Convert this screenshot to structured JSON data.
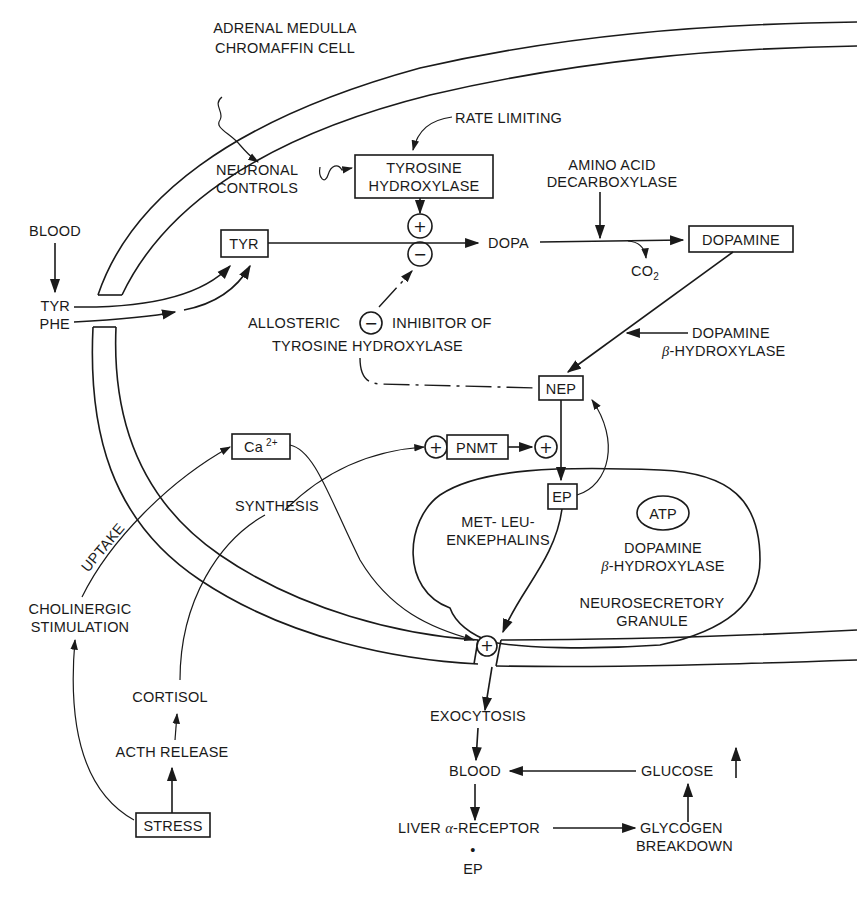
{
  "diagram": {
    "title_line1": "ADRENAL MEDULLA",
    "title_line2": "CHROMAFFIN CELL",
    "colors": {
      "ink": "#1a1a1a",
      "background": "#ffffff"
    },
    "labels": {
      "rate_limiting": "RATE LIMITING",
      "neuronal_controls_1": "NEURONAL",
      "neuronal_controls_2": "CONTROLS",
      "tyrosine_hydroxylase_1": "TYROSINE",
      "tyrosine_hydroxylase_2": "HYDROXYLASE",
      "amino_acid_decarboxylase_1": "AMINO ACID",
      "amino_acid_decarboxylase_2": "DECARBOXYLASE",
      "blood_top": "BLOOD",
      "tyr_box": "TYR",
      "dopa": "DOPA",
      "dopamine_box": "DOPAMINE",
      "co2": "CO",
      "co2_sub": "2",
      "tyr_in": "TYR",
      "phe_in": "PHE",
      "allosteric": "ALLOSTERIC",
      "inhibitor_of": "INHIBITOR OF",
      "tyrosine_hydroxylase_line": "TYROSINE HYDROXYLASE",
      "dopamine_bh_1": "DOPAMINE",
      "dopamine_bh_beta": "β",
      "dopamine_bh_2": "-HYDROXYLASE",
      "nep_box": "NEP",
      "ca_box": "Ca",
      "ca_sup": "2+",
      "pnmt_box": "PNMT",
      "synthesis": "SYNTHESIS",
      "ep_box": "EP",
      "atp": "ATP",
      "enkephalins_1": "MET- LEU-",
      "enkephalins_2": "ENKEPHALINS",
      "granule_dbh_1": "DOPAMINE",
      "granule_dbh_beta": "β",
      "granule_dbh_2": "-HYDROXYLASE",
      "granule_1": "NEUROSECRETORY",
      "granule_2": "GRANULE",
      "uptake": "UPTAKE",
      "cholinergic_1": "CHOLINERGIC",
      "cholinergic_2": "STIMULATION",
      "cortisol": "CORTISOL",
      "acth_release": "ACTH RELEASE",
      "stress_box": "STRESS",
      "exocytosis": "EXOCYTOSIS",
      "blood_bottom": "BLOOD",
      "glucose": "GLUCOSE",
      "liver_1": "LIVER ",
      "liver_alpha": "α",
      "liver_2": "-RECEPTOR",
      "glycogen_1": "GLYCOGEN",
      "glycogen_2": "BREAKDOWN",
      "bullet": "•",
      "ep_bottom": "EP"
    },
    "symbols": {
      "plus": "+",
      "minus": "−",
      "up_arrow": "↑"
    }
  }
}
